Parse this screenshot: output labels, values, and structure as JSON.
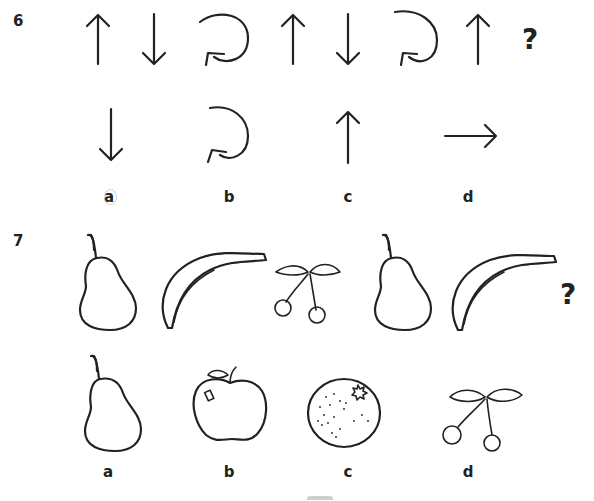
{
  "questions": [
    {
      "number": "6",
      "sequence": [
        "arrow-up",
        "arrow-down",
        "arrow-circular",
        "arrow-up",
        "arrow-down",
        "arrow-circular",
        "arrow-up"
      ],
      "missing_marker": "?",
      "options": [
        {
          "label": "a",
          "symbol": "arrow-down"
        },
        {
          "label": "b",
          "symbol": "arrow-circular"
        },
        {
          "label": "c",
          "symbol": "arrow-up"
        },
        {
          "label": "d",
          "symbol": "arrow-right"
        }
      ]
    },
    {
      "number": "7",
      "sequence": [
        "pear",
        "banana",
        "cherries",
        "pear",
        "banana"
      ],
      "missing_marker": "?",
      "options": [
        {
          "label": "a",
          "symbol": "pear"
        },
        {
          "label": "b",
          "symbol": "apple"
        },
        {
          "label": "c",
          "symbol": "orange"
        },
        {
          "label": "d",
          "symbol": "cherries"
        }
      ]
    }
  ],
  "colors": {
    "ink": "#222222",
    "background": "#ffffff"
  }
}
